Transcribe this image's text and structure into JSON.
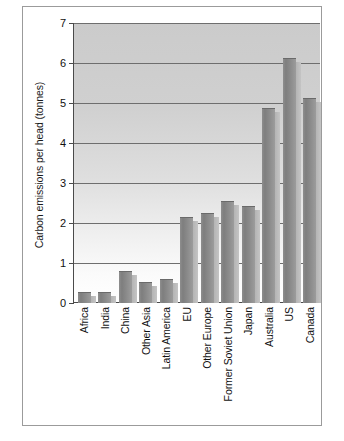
{
  "chart_data": {
    "type": "bar",
    "title": "",
    "xlabel": "",
    "ylabel": "Carbon emissions per head (tonnes)",
    "ylim": [
      0,
      7
    ],
    "yticks": [
      0,
      1,
      2,
      3,
      4,
      5,
      6,
      7
    ],
    "grid": true,
    "legend": "none",
    "categories": [
      "Africa",
      "India",
      "China",
      "Other Asia",
      "Latin America",
      "EU",
      "Other Europe",
      "Former Soviet Union",
      "Japan",
      "Australia",
      "US",
      "Canada"
    ],
    "values": [
      0.25,
      0.25,
      0.78,
      0.5,
      0.57,
      2.12,
      2.22,
      2.52,
      2.4,
      4.85,
      6.1,
      5.1
    ]
  },
  "style": {
    "bar_color": "#8a8a8a",
    "bar_shadow_color": "#bcbcbc",
    "gridline_color": "#6e6e6e",
    "axis_color": "#4a4a4a",
    "frame_color": "#9b9b9b",
    "text_color": "#111111"
  }
}
